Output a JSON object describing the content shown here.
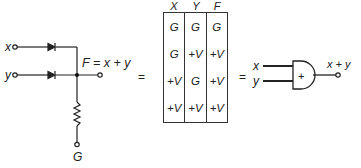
{
  "circuit": {
    "input_x": "x",
    "input_y": "y",
    "output_expr": "F = x + y",
    "ground_label": "G",
    "components": [
      "diode-x",
      "diode-y",
      "resistor"
    ]
  },
  "equals_1": "=",
  "equals_2": "=",
  "truth_table": {
    "headers": [
      "X",
      "Y",
      "F"
    ],
    "rows": [
      [
        "G",
        "G",
        "G"
      ],
      [
        "G",
        "+V",
        "+V"
      ],
      [
        "+V",
        "G",
        "+V"
      ],
      [
        "+V",
        "+V",
        "+V"
      ]
    ]
  },
  "gate": {
    "input_x": "x",
    "input_y": "y",
    "symbol": "+",
    "output": "x + y"
  }
}
